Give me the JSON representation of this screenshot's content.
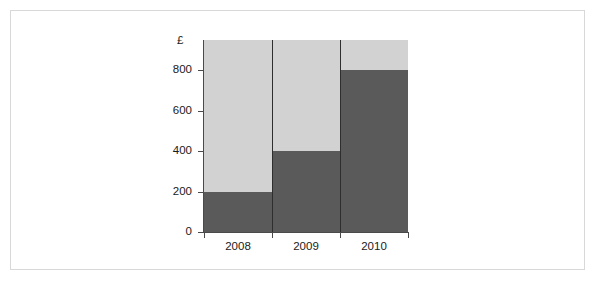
{
  "frame": {
    "border_color": "#d8d8d8",
    "background": "#ffffff"
  },
  "chart_data": {
    "type": "bar",
    "title": "",
    "xlabel": "",
    "ylabel": "£",
    "categories": [
      "2008",
      "2009",
      "2010"
    ],
    "values": [
      200,
      400,
      800
    ],
    "series": [
      {
        "name": "",
        "values": [
          200,
          400,
          800
        ]
      }
    ],
    "ylim": [
      0,
      950
    ],
    "yticks": [
      0,
      200,
      400,
      600,
      800
    ],
    "ytick_labels": [
      "0",
      "200",
      "400",
      "600",
      "800"
    ],
    "grid": false,
    "legend": null,
    "colors": {
      "bar": "#5a5a5a",
      "plot_background": "#d2d2d2",
      "axis": "#4a4a4a",
      "separator": "#2e2e2e",
      "text": "#1a1a1a"
    }
  }
}
